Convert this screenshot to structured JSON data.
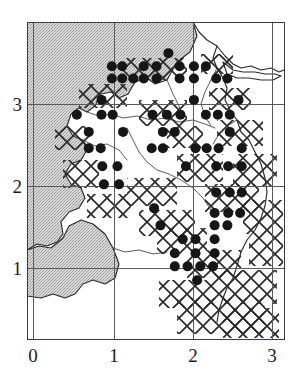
{
  "figure": {
    "type": "distribution-map",
    "title": "",
    "frame": {
      "left": 27,
      "top": 22,
      "width": 258,
      "height": 318
    }
  },
  "axes": {
    "x": {
      "label": "",
      "ticks": [
        {
          "value": 0,
          "label": "0",
          "px": 33
        },
        {
          "value": 1,
          "label": "1",
          "px": 114
        },
        {
          "value": 2,
          "label": "2",
          "px": 193
        },
        {
          "value": 3,
          "label": "3",
          "px": 272
        }
      ],
      "range": [
        -0.08,
        3.16
      ]
    },
    "y": {
      "label": "",
      "ticks": [
        {
          "value": 1,
          "label": "1",
          "px": 268
        },
        {
          "value": 2,
          "label": "2",
          "px": 186
        },
        {
          "value": 3,
          "label": "3",
          "px": 104
        }
      ],
      "range": [
        0.14,
        4.02
      ]
    }
  },
  "colors": {
    "frame": "#3a3a3a",
    "grid": "#5a5a5a",
    "dot": "#161616",
    "sea_fill": "#c8c8c8",
    "coast_line": "#2a2a2a",
    "hatch_line": "#2a2a2a",
    "river_line": "#4a4a4a",
    "background": "#ffffff",
    "text": "#1c1c1c"
  },
  "chart_data": {
    "type": "scatter",
    "title": "",
    "xlabel": "",
    "ylabel": "",
    "xlim": [
      -0.08,
      3.16
    ],
    "ylim": [
      0.14,
      4.02
    ],
    "grid": true,
    "legend": null,
    "marker": {
      "shape": "circle",
      "fill": "#161616",
      "size_px": 10
    },
    "series": [
      {
        "name": "presence records",
        "count": 106,
        "points": [
          [
            1.7,
            3.62
          ],
          [
            0.99,
            3.46
          ],
          [
            1.12,
            3.46
          ],
          [
            1.39,
            3.46
          ],
          [
            1.55,
            3.46
          ],
          [
            1.84,
            3.46
          ],
          [
            2.02,
            3.46
          ],
          [
            2.17,
            3.46
          ],
          [
            0.99,
            3.31
          ],
          [
            1.12,
            3.31
          ],
          [
            1.26,
            3.31
          ],
          [
            1.39,
            3.31
          ],
          [
            1.55,
            3.31
          ],
          [
            1.84,
            3.31
          ],
          [
            2.02,
            3.31
          ],
          [
            2.3,
            3.31
          ],
          [
            2.44,
            3.31
          ],
          [
            0.86,
            3.05
          ],
          [
            2.02,
            3.05
          ],
          [
            2.58,
            3.05
          ],
          [
            0.55,
            2.87
          ],
          [
            0.86,
            2.87
          ],
          [
            1.0,
            2.87
          ],
          [
            1.5,
            2.87
          ],
          [
            1.68,
            2.87
          ],
          [
            1.85,
            2.87
          ],
          [
            2.17,
            2.87
          ],
          [
            2.32,
            2.87
          ],
          [
            2.47,
            2.87
          ],
          [
            0.7,
            2.66
          ],
          [
            1.13,
            2.66
          ],
          [
            1.63,
            2.66
          ],
          [
            1.78,
            2.66
          ],
          [
            2.47,
            2.66
          ],
          [
            0.7,
            2.46
          ],
          [
            0.85,
            2.46
          ],
          [
            1.49,
            2.46
          ],
          [
            1.63,
            2.46
          ],
          [
            2.04,
            2.46
          ],
          [
            2.18,
            2.46
          ],
          [
            2.33,
            2.46
          ],
          [
            2.62,
            2.46
          ],
          [
            0.87,
            2.24
          ],
          [
            1.06,
            2.24
          ],
          [
            1.92,
            2.24
          ],
          [
            2.3,
            2.24
          ],
          [
            2.45,
            2.24
          ],
          [
            2.62,
            2.24
          ],
          [
            0.89,
            2.02
          ],
          [
            1.08,
            2.02
          ],
          [
            2.3,
            1.92
          ],
          [
            2.47,
            1.92
          ],
          [
            2.62,
            1.92
          ],
          [
            1.52,
            1.73
          ],
          [
            2.28,
            1.67
          ],
          [
            2.45,
            1.67
          ],
          [
            2.6,
            1.67
          ],
          [
            1.6,
            1.52
          ],
          [
            2.28,
            1.52
          ],
          [
            2.44,
            1.52
          ],
          [
            1.88,
            1.35
          ],
          [
            2.04,
            1.35
          ],
          [
            2.28,
            1.35
          ],
          [
            1.78,
            1.18
          ],
          [
            2.04,
            1.18
          ],
          [
            2.28,
            1.18
          ],
          [
            1.78,
            1.02
          ],
          [
            1.94,
            1.02
          ],
          [
            2.1,
            1.02
          ],
          [
            2.26,
            1.02
          ],
          [
            2.06,
            0.85
          ]
        ]
      }
    ]
  },
  "overlays": {
    "sea": {
      "name": "sea-shading",
      "pattern": "stipple",
      "description": "grey stippled water body occupying upper-left and left margin"
    },
    "land": {
      "name": "land-area",
      "fill": "#ffffff"
    },
    "hatching": {
      "name": "hatched-zone",
      "pattern": "diagonal-cross",
      "description": "X-shaped cross hatching marking surveyed squares"
    },
    "coastline": {
      "name": "coastline",
      "stroke": "#2a2a2a"
    },
    "rivers": {
      "name": "river-network",
      "stroke": "#4a4a4a"
    }
  }
}
